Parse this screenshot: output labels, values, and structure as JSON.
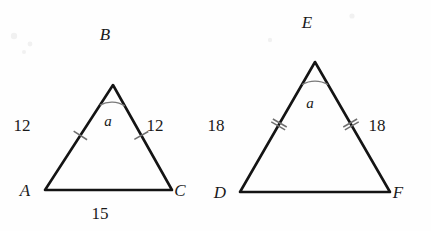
{
  "figure": {
    "type": "geometry-diagram",
    "background_color": "#fefefe",
    "line_color": "#141414",
    "mark_color": "#6f6f6f"
  },
  "triangles": [
    {
      "id": "abc",
      "name": "triangle-abc",
      "vertices": [
        {
          "key": "A",
          "label": "A",
          "x": 45,
          "y": 190,
          "label_x": 25,
          "label_y": 196
        },
        {
          "key": "B",
          "label": "B",
          "x": 113,
          "y": 85,
          "label_x": 105,
          "label_y": 40
        },
        {
          "key": "C",
          "label": "C",
          "x": 172,
          "y": 190,
          "label_x": 180,
          "label_y": 196
        }
      ],
      "sides": [
        {
          "key": "AB",
          "label": "12",
          "label_x": 22,
          "label_y": 131,
          "ticks": 1,
          "tick_t": 0.52
        },
        {
          "key": "BC",
          "label": "12",
          "label_x": 155,
          "label_y": 131,
          "ticks": 1,
          "tick_t": 0.48
        },
        {
          "key": "AC",
          "label": "15",
          "label_x": 100,
          "label_y": 219,
          "ticks": 0,
          "tick_t": 0.5
        }
      ],
      "angle": {
        "at": "B",
        "label": "a",
        "label_x": 108,
        "label_y": 126,
        "arc_radius": 24
      }
    },
    {
      "id": "def",
      "name": "triangle-def",
      "vertices": [
        {
          "key": "D",
          "label": "D",
          "x": 240,
          "y": 192,
          "label_x": 220,
          "label_y": 198
        },
        {
          "key": "E",
          "label": "E",
          "x": 315,
          "y": 62,
          "label_x": 307,
          "label_y": 28
        },
        {
          "key": "F",
          "label": "F",
          "x": 390,
          "y": 192,
          "label_x": 398,
          "label_y": 198
        }
      ],
      "sides": [
        {
          "key": "DE",
          "label": "18",
          "label_x": 216,
          "label_y": 131,
          "ticks": 2,
          "tick_t": 0.52
        },
        {
          "key": "EF",
          "label": "18",
          "label_x": 377,
          "label_y": 131,
          "ticks": 2,
          "tick_t": 0.48
        },
        {
          "key": "DF",
          "label": "",
          "label_x": 315,
          "label_y": 219,
          "ticks": 0,
          "tick_t": 0.5
        }
      ],
      "angle": {
        "at": "E",
        "label": "a",
        "label_x": 310,
        "label_y": 108,
        "arc_radius": 26
      }
    }
  ]
}
